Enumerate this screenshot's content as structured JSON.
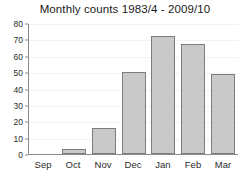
{
  "chart_data": {
    "type": "bar",
    "title": "Monthly counts 1983/4 - 2009/10",
    "xlabel": "",
    "ylabel": "",
    "categories": [
      "Sep",
      "Oct",
      "Nov",
      "Dec",
      "Jan",
      "Feb",
      "Mar"
    ],
    "values": [
      0,
      3,
      16,
      50,
      72,
      67,
      49
    ],
    "ylim": [
      0,
      80
    ],
    "yticks": [
      0,
      10,
      20,
      30,
      40,
      50,
      60,
      70,
      80
    ],
    "ytick_labels": [
      "0",
      "10",
      "20",
      "30",
      "40",
      "50",
      "60",
      "70",
      "80"
    ],
    "grid": true,
    "legend": false,
    "bar_color": "#c9c9c9",
    "bar_edge_color": "#7d7d7d",
    "axis_color": "#8a8a8a",
    "grid_color": "#f2f2f2",
    "text_color": "#2b2b2b",
    "background": "#ffffff"
  }
}
